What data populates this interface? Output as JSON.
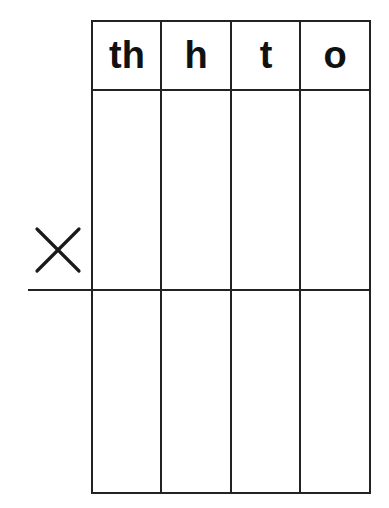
{
  "worksheet": {
    "type": "column multiplication place-value grid",
    "operator_symbol": "×",
    "operator_icon": "multiply-icon",
    "columns": [
      {
        "key": "th",
        "label": "th"
      },
      {
        "key": "h",
        "label": "h"
      },
      {
        "key": "t",
        "label": "t"
      },
      {
        "key": "o",
        "label": "o"
      }
    ],
    "rows": [
      {
        "name": "multiplication-row",
        "cells": [
          "",
          "",
          "",
          ""
        ]
      },
      {
        "name": "answer-row",
        "cells": [
          "",
          "",
          "",
          ""
        ]
      }
    ],
    "colors": {
      "line": "#222222",
      "text": "#111111",
      "background": "#ffffff"
    }
  }
}
